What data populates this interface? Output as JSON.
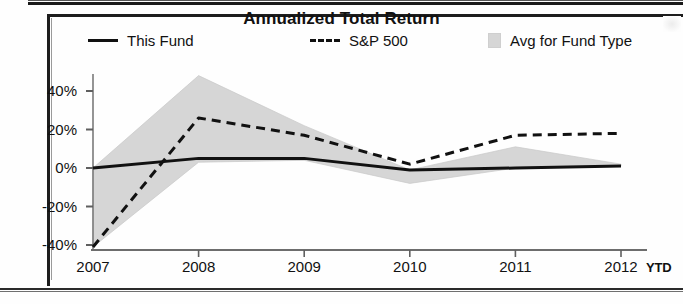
{
  "chart_data": {
    "type": "line",
    "title": "Annualized Total Return",
    "xlabel": "",
    "ylabel": "",
    "grid": false,
    "legend_position": "top",
    "categories": [
      "2007",
      "2008",
      "2009",
      "2010",
      "2011",
      "2012"
    ],
    "x_tick_labels": [
      "2007",
      "2008",
      "2009",
      "2010",
      "2011",
      "2012"
    ],
    "x_axis_suffix_label": "YTD",
    "y_tick_labels": [
      "40%",
      "20%",
      "0%",
      "-20%",
      "-40%"
    ],
    "y_tick_values": [
      40,
      20,
      0,
      -20,
      -40
    ],
    "ylim": [
      -44,
      50
    ],
    "series": [
      {
        "name": "This Fund",
        "style": "solid",
        "color": "#111111",
        "values": [
          0,
          5,
          5,
          -1,
          0,
          1
        ]
      },
      {
        "name": "S&P 500",
        "style": "dashed",
        "color": "#111111",
        "values": [
          -41,
          26,
          17,
          2,
          17,
          18
        ]
      }
    ],
    "band": {
      "name": "Avg for Fund Type",
      "style": "shaded-area",
      "color": "#d6d6d6",
      "upper": [
        0,
        48,
        22,
        -1,
        11,
        2
      ],
      "lower": [
        -41,
        3,
        4,
        -8,
        0,
        1
      ]
    }
  },
  "legend": {
    "items": [
      {
        "label": "This Fund",
        "marker": "solid-line-swatch"
      },
      {
        "label": "S&P 500",
        "marker": "dashed-line-swatch"
      },
      {
        "label": "Avg for Fund Type",
        "marker": "shaded-box-swatch"
      }
    ]
  },
  "colors": {
    "line": "#111111",
    "band": "#d6d6d6",
    "axis": "#6f6f6f",
    "frame": "#1d1d1d"
  }
}
